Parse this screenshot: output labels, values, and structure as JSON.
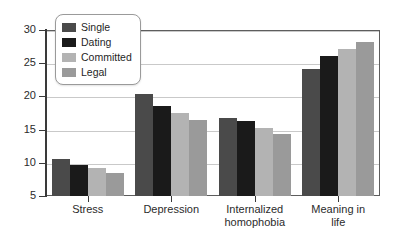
{
  "chart_data": {
    "type": "bar",
    "title": "",
    "subtitle": "",
    "xlabel": "",
    "ylabel": "",
    "categories": [
      "Stress",
      "Depression",
      "Internalized\nhomophobia",
      "Meaning in\nlife"
    ],
    "series": [
      {
        "name": "Single",
        "color": "#4a4a4a",
        "values": [
          10.5,
          20.3,
          16.7,
          24.2
        ]
      },
      {
        "name": "Dating",
        "color": "#1a1a1a",
        "values": [
          9.7,
          18.5,
          16.3,
          26.1
        ]
      },
      {
        "name": "Committed",
        "color": "#b3b3b3",
        "values": [
          9.2,
          17.5,
          15.3,
          27.2
        ]
      },
      {
        "name": "Legal",
        "color": "#9a9a9a",
        "values": [
          8.4,
          16.5,
          14.3,
          28.2
        ]
      }
    ],
    "ylim": [
      5,
      30
    ],
    "yticks": [
      5,
      10,
      15,
      20,
      25,
      30
    ],
    "ytick_labels": [
      "5",
      "10",
      "15",
      "20",
      "25",
      "30"
    ],
    "grid": true,
    "grid_axis": "y",
    "legend_position": "top-left-inside",
    "legend_entries": [
      "Single",
      "Dating",
      "Committed",
      "Legal"
    ],
    "annotations": []
  },
  "colors": {
    "axis": "#3a3a3a",
    "frame": "#5d5d5d",
    "gridline": "#c9c9c9",
    "background": "#ffffff",
    "text": "#2b2b2b"
  }
}
